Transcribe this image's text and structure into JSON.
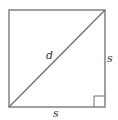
{
  "diagram": {
    "stroke_color": "#6e6e6e",
    "labels": {
      "diagonal": "d",
      "right_side": "s",
      "bottom_side": "s"
    },
    "shapes": {
      "square": {
        "x1": 9,
        "y1": 10,
        "x2": 105,
        "y2": 107
      },
      "diagonal": {
        "from": [
          9,
          107
        ],
        "to": [
          105,
          10
        ]
      },
      "right_angle_marker": {
        "x": 94,
        "y": 96,
        "size": 11
      }
    }
  }
}
